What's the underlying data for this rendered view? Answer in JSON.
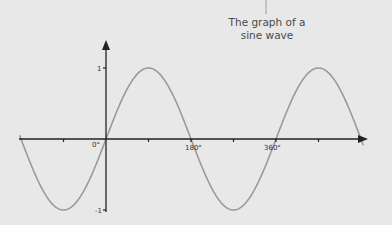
{
  "chart_data": {
    "type": "line",
    "title": "The graph of a sine wave",
    "title_lines": [
      "The graph of a",
      "sine wave"
    ],
    "xlabel": "",
    "ylabel": "",
    "function": "sin(x)",
    "x_unit": "degrees",
    "x_ticks": [
      -90,
      0,
      90,
      180,
      270,
      360,
      450
    ],
    "x_tick_labels": [
      {
        "value": 0,
        "label": "0°"
      },
      {
        "value": 180,
        "label": "180°"
      },
      {
        "value": 360,
        "label": "360°"
      }
    ],
    "y_ticks": [
      -1,
      0,
      1
    ],
    "y_tick_labels": [
      {
        "value": 1,
        "label": "1"
      },
      {
        "value": -1,
        "label": "-1"
      }
    ],
    "xlim": [
      -185,
      550
    ],
    "ylim": [
      -1,
      1
    ],
    "grid": false,
    "legend": null,
    "series": [
      {
        "name": "sin(x)",
        "x": [
          -180,
          -135,
          -90,
          -45,
          0,
          45,
          90,
          135,
          180,
          225,
          270,
          315,
          360,
          405,
          450,
          495,
          540
        ],
        "values": [
          0,
          -0.707,
          -1,
          -0.707,
          0,
          0.707,
          1,
          0.707,
          0,
          -0.707,
          -1,
          -0.707,
          0,
          0.707,
          1,
          0.707,
          0
        ]
      }
    ],
    "colors": {
      "background": "#e8e8e8",
      "axis": "#222222",
      "curve": "#9a9a9a",
      "text": "#4a4a4a"
    }
  },
  "labels": {
    "title_line1": "The graph of a",
    "title_line2": "sine wave",
    "x_zero": "0°",
    "x_180": "180°",
    "x_360": "360°",
    "y_one": "1",
    "y_minus_one": "-1"
  }
}
